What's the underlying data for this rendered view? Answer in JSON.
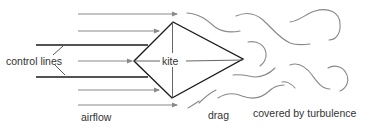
{
  "diagram": {
    "labels": {
      "control_lines": "control lines",
      "kite": "kite",
      "airflow": "airflow",
      "drag": "drag",
      "turbulence": "covered by turbulence"
    },
    "colors": {
      "arrow": "#8a8a8a",
      "kite_outline": "#1a1a1a",
      "control_line": "#1a1a1a",
      "turbulence": "#888888",
      "text": "#333333",
      "background": "#ffffff"
    },
    "airflow_arrows": [
      {
        "y": 14,
        "x1": 78,
        "x2": 178
      },
      {
        "y": 31,
        "x1": 78,
        "x2": 160
      },
      {
        "y": 61,
        "x1": 78,
        "x2": 134
      },
      {
        "y": 90,
        "x1": 78,
        "x2": 160
      },
      {
        "y": 105,
        "x1": 78,
        "x2": 178
      }
    ]
  }
}
